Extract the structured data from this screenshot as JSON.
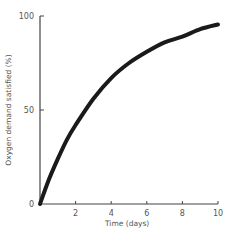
{
  "chart_data": {
    "type": "line",
    "title": "",
    "xlabel": "Time (days)",
    "ylabel": "Oxygen demand satisfied (%)",
    "xlim": [
      0,
      10
    ],
    "ylim": [
      0,
      100
    ],
    "x_ticks": [
      2,
      4,
      6,
      8,
      10
    ],
    "x_tick_labels": [
      "2",
      "4",
      "6",
      "8",
      "10"
    ],
    "y_ticks": [
      0,
      50,
      100
    ],
    "y_tick_labels": [
      "0",
      "50",
      "100"
    ],
    "grid": false,
    "legend": null,
    "series": [
      {
        "name": "Oxygen demand satisfied",
        "x": [
          0,
          0.5,
          1,
          1.5,
          2,
          3,
          4,
          5,
          6,
          7,
          8,
          9,
          10
        ],
        "values": [
          0,
          13,
          24,
          34,
          42,
          56,
          67,
          75,
          81,
          86,
          89,
          93,
          95.5
        ]
      }
    ],
    "line_color": "#1a1a1a"
  }
}
